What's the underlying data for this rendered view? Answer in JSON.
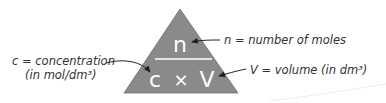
{
  "diagram": {
    "type": "formula-triangle",
    "triangle": {
      "top": "n",
      "bottom_left": "c",
      "operator": "×",
      "bottom_right": "V",
      "fill": "#8a8a8a",
      "text_color": "#ffffff"
    },
    "labels": {
      "n": "n = number of moles",
      "c_line1": "c = concentration",
      "c_line2": "(in mol/dm³)",
      "v": "V = volume (in dm³)"
    }
  }
}
